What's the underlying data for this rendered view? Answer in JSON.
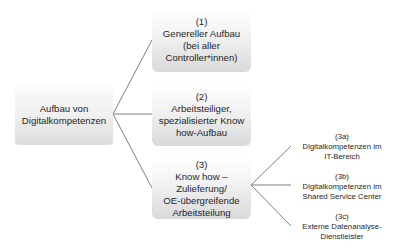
{
  "root": {
    "lines": [
      "Aufbau von",
      "Digitalkompetenzen"
    ]
  },
  "branches": [
    {
      "number": "(1)",
      "lines": [
        "Genereller Aufbau",
        "(bei aller",
        "Controller*innen)"
      ]
    },
    {
      "number": "(2)",
      "lines": [
        "Arbeitsteiliger,",
        "spezialisierter Know",
        "how-Aufbau"
      ]
    },
    {
      "number": "(3)",
      "lines": [
        "Know how –",
        "Zulieferung/",
        "OE-übergreifende",
        "Arbeitsteilung"
      ]
    }
  ],
  "sub_branches": [
    {
      "number": "(3a)",
      "lines": [
        "Digitalkompetenzen im",
        "IT-Bereich"
      ]
    },
    {
      "number": "(3b)",
      "lines": [
        "Digitalkompetenzen im",
        "Shared Service Center"
      ]
    },
    {
      "number": "(3c)",
      "lines": [
        "Externe Datenanalyse-",
        "Dienstleister"
      ]
    }
  ]
}
